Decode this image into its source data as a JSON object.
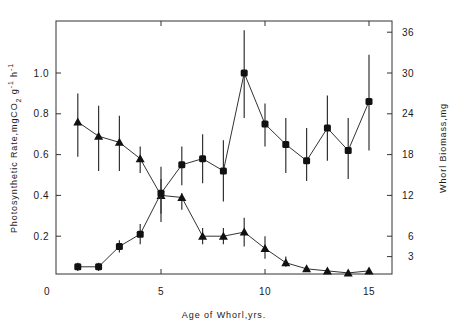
{
  "chart_data": {
    "type": "line",
    "title": "",
    "xlabel": "Age of Whorl,yrs.",
    "ylabel_left": "Photosynthetic Rate,mgCO2 g-1 h-1",
    "ylabel_right": "Whorl Biomass,mg",
    "xlim": [
      0,
      16
    ],
    "ylim_left": [
      0,
      1.2
    ],
    "ylim_right": [
      0,
      36
    ],
    "x_ticks": [
      0,
      5,
      10,
      15
    ],
    "y_left_ticks": [
      0.2,
      0.4,
      0.6,
      0.8,
      1.0
    ],
    "y_right_ticks": [
      3,
      6,
      12,
      18,
      24,
      30,
      36
    ],
    "grid": false,
    "legend": null,
    "x": [
      1,
      2,
      3,
      4,
      5,
      6,
      7,
      8,
      9,
      10,
      11,
      12,
      13,
      14,
      15
    ],
    "series": [
      {
        "name": "Photosynthetic Rate",
        "marker": "triangle",
        "axis": "left",
        "values": [
          0.76,
          0.69,
          0.66,
          0.58,
          0.4,
          0.39,
          0.2,
          0.2,
          0.22,
          0.14,
          0.07,
          0.04,
          0.03,
          0.02,
          0.03
        ],
        "err_low": [
          0.59,
          0.52,
          0.52,
          0.51,
          0.31,
          0.33,
          0.16,
          0.16,
          0.15,
          0.09,
          0.05,
          0.03,
          0.02,
          0.01,
          0.02
        ],
        "err_high": [
          0.9,
          0.84,
          0.79,
          0.64,
          0.48,
          0.41,
          0.24,
          0.24,
          0.29,
          0.2,
          0.1,
          0.05,
          0.04,
          0.03,
          0.04
        ]
      },
      {
        "name": "Whorl Biomass",
        "marker": "square",
        "axis": "right",
        "values_left_scale": [
          0.05,
          0.05,
          0.15,
          0.21,
          0.41,
          0.55,
          0.58,
          0.52,
          1.0,
          0.75,
          0.65,
          0.57,
          0.73,
          0.62,
          0.86
        ],
        "values": [
          1.5,
          1.5,
          4.5,
          6.3,
          12.3,
          16.5,
          17.4,
          15.6,
          30.0,
          22.5,
          19.5,
          17.1,
          21.9,
          18.6,
          25.8
        ],
        "err_low": [
          0.03,
          0.03,
          0.12,
          0.16,
          0.27,
          0.45,
          0.46,
          0.37,
          0.78,
          0.64,
          0.51,
          0.47,
          0.57,
          0.48,
          0.62
        ],
        "err_high": [
          0.07,
          0.07,
          0.18,
          0.26,
          0.54,
          0.64,
          0.7,
          0.67,
          1.21,
          0.85,
          0.78,
          0.73,
          0.89,
          0.78,
          1.09
        ]
      }
    ]
  },
  "labels": {
    "x_axis_title": "Age of Whorl,yrs.",
    "y_left_title_main": "Photosynthetic Rate,mgCO",
    "y_left_title_sub": "2",
    "y_left_title_tail": " g",
    "y_left_title_sup1": "-1",
    "y_left_title_h": " h",
    "y_left_title_sup2": "-1",
    "y_right_title": "Whorl Biomass,mg"
  }
}
